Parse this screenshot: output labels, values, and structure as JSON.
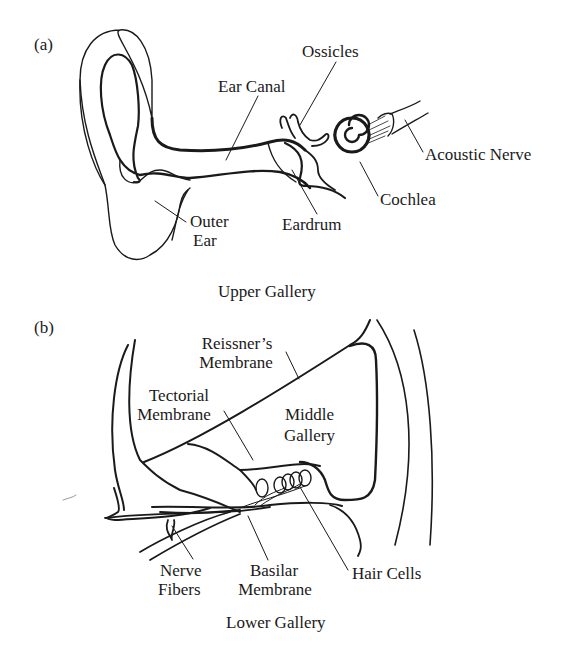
{
  "panel_a": {
    "tag": "(a)",
    "caption": "Upper Gallery",
    "labels": {
      "ossicles": "Ossicles",
      "ear_canal": "Ear Canal",
      "acoustic_nerve": "Acoustic Nerve",
      "cochlea": "Cochlea",
      "eardrum": "Eardrum",
      "outer_ear_1": "Outer",
      "outer_ear_2": "Ear"
    }
  },
  "panel_b": {
    "tag": "(b)",
    "caption": "Lower Gallery",
    "labels": {
      "reissners_1": "Reissner’s",
      "reissners_2": "Membrane",
      "tectorial_1": "Tectorial",
      "tectorial_2": "Membrane",
      "middle_gallery_1": "Middle",
      "middle_gallery_2": "Gallery",
      "nerve_fibers_1": "Nerve",
      "nerve_fibers_2": "Fibers",
      "basilar_1": "Basilar",
      "basilar_2": "Membrane",
      "hair_cells": "Hair Cells"
    }
  }
}
